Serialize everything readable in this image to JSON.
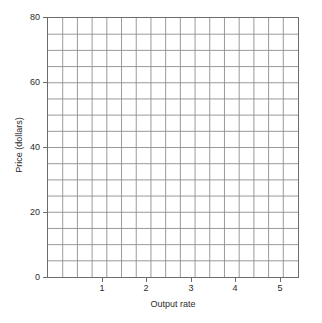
{
  "chart_data": {
    "type": "line",
    "title": "",
    "subtitle": "",
    "xlabel": "Output rate",
    "ylabel": "Price (dollars)",
    "xlim": [
      0,
      5.65
    ],
    "ylim": [
      0,
      80
    ],
    "x_ticks": [
      1,
      2,
      3,
      4,
      5
    ],
    "x_tick_labels": [
      "1",
      "2",
      "3",
      "4",
      "5"
    ],
    "y_ticks": [
      0,
      20,
      40,
      60,
      80
    ],
    "y_tick_labels": [
      "0",
      "20",
      "40",
      "60",
      "80"
    ],
    "grid": true,
    "grid_columns": 17,
    "grid_rows": 16,
    "grid_minor_x_step": 0.3333,
    "grid_minor_y_step": 5,
    "legend": null,
    "legend_position": "none",
    "series": [],
    "annotations": []
  },
  "axes": {
    "y": {
      "label": "Price (dollars)",
      "ticks": [
        {
          "value": 80,
          "label": "80"
        },
        {
          "value": 60,
          "label": "60"
        },
        {
          "value": 40,
          "label": "40"
        },
        {
          "value": 20,
          "label": "20"
        },
        {
          "value": 0,
          "label": "0"
        }
      ]
    },
    "x": {
      "label": "Output rate",
      "ticks": [
        {
          "value": 1,
          "label": "1"
        },
        {
          "value": 2,
          "label": "2"
        },
        {
          "value": 3,
          "label": "3"
        },
        {
          "value": 4,
          "label": "4"
        },
        {
          "value": 5,
          "label": "5"
        }
      ]
    }
  },
  "style": {
    "background": "#ffffff",
    "border_color": "#6b6b6b",
    "grid_color": "#8d8d8d",
    "text_color": "#2b2b2b"
  }
}
